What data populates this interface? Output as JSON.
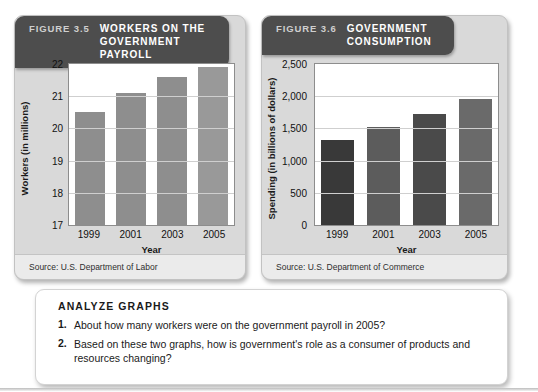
{
  "figures": [
    {
      "fig_number": "FIGURE 3.5",
      "title_line1": "WORKERS ON THE",
      "title_line2": "GOVERNMENT PAYROLL",
      "source": "Source: U.S. Department of Labor",
      "chart_data": {
        "type": "bar",
        "title": "Workers on the Government Payroll",
        "categories": [
          "1999",
          "2001",
          "2003",
          "2005"
        ],
        "values": [
          20.5,
          21.1,
          21.6,
          21.9
        ],
        "xlabel": "Year",
        "ylabel": "Workers (in millions)",
        "ylim": [
          17,
          22
        ],
        "yticks": [
          22,
          21,
          20,
          19,
          18,
          17
        ],
        "ytick_labels": [
          "22",
          "21",
          "20",
          "19",
          "18",
          "17"
        ],
        "grid": true,
        "legend": "none",
        "bar_colors": [
          "#8e8e8e",
          "#8e8e8e",
          "#8e8e8e",
          "#999999"
        ]
      }
    },
    {
      "fig_number": "FIGURE 3.6",
      "title_line1": "GOVERNMENT",
      "title_line2": "CONSUMPTION",
      "source": "Source: U.S. Department of Commerce",
      "chart_data": {
        "type": "bar",
        "title": "Government Consumption",
        "categories": [
          "1999",
          "2001",
          "2003",
          "2005"
        ],
        "values": [
          1320,
          1520,
          1730,
          1960
        ],
        "xlabel": "Year",
        "ylabel": "Spending (in billions of dollars)",
        "ylim": [
          0,
          2500
        ],
        "yticks": [
          2500,
          2000,
          1500,
          1000,
          500,
          0
        ],
        "ytick_labels": [
          "2,500",
          "2,000",
          "1,500",
          "1,000",
          "500",
          "0"
        ],
        "grid": true,
        "legend": "none",
        "bar_colors": [
          "#393939",
          "#5c5c5c",
          "#4a4a4a",
          "#6a6a6a"
        ]
      }
    }
  ],
  "analyze": {
    "heading": "ANALYZE GRAPHS",
    "questions": [
      {
        "num": "1.",
        "text": "About how many workers were on the government payroll in 2005?"
      },
      {
        "num": "2.",
        "text": "Based on these two graphs, how is government's role as a consumer of products and resources changing?"
      }
    ]
  },
  "colors": {
    "header_bar": "#4d4d4d",
    "panel_bg": "#d9d9d9",
    "plot_bg": "#ffffff",
    "gridline": "#cfcfcf",
    "source_strip": "#ebebeb"
  }
}
